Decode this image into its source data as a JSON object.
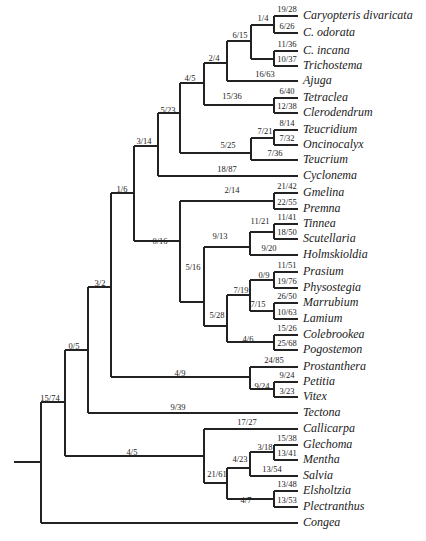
{
  "diagram": {
    "type": "phylogenetic-tree",
    "colors": {
      "line": "#222222",
      "text": "#1a1a1a",
      "background": "#ffffff"
    },
    "taxa": [
      {
        "name": "Caryopteris divaricata",
        "y": 16
      },
      {
        "name": "C. odorata",
        "y": 33
      },
      {
        "name": "C. incana",
        "y": 51
      },
      {
        "name": "Trichostema",
        "y": 66
      },
      {
        "name": "Ajuga",
        "y": 81
      },
      {
        "name": "Tetraclea",
        "y": 98
      },
      {
        "name": "Clerodendrum",
        "y": 113
      },
      {
        "name": "Teucridium",
        "y": 130
      },
      {
        "name": "Oncinocalyx",
        "y": 145
      },
      {
        "name": "Teucrium",
        "y": 160
      },
      {
        "name": "Cyclonema",
        "y": 176
      },
      {
        "name": "Gmelina",
        "y": 193
      },
      {
        "name": "Premna",
        "y": 209
      },
      {
        "name": "Tinnea",
        "y": 224
      },
      {
        "name": "Scutellaria",
        "y": 239
      },
      {
        "name": "Holmskioldia",
        "y": 255
      },
      {
        "name": "Prasium",
        "y": 272
      },
      {
        "name": "Physostegia",
        "y": 288
      },
      {
        "name": "Marrubium",
        "y": 303
      },
      {
        "name": "Lamium",
        "y": 319
      },
      {
        "name": "Colebrookea",
        "y": 335
      },
      {
        "name": "Pogostemon",
        "y": 350
      },
      {
        "name": "Prostanthera",
        "y": 367
      },
      {
        "name": "Petitia",
        "y": 382
      },
      {
        "name": "Vitex",
        "y": 397
      },
      {
        "name": "Tectona",
        "y": 413
      },
      {
        "name": "Callicarpa",
        "y": 429
      },
      {
        "name": "Glechoma",
        "y": 445
      },
      {
        "name": "Mentha",
        "y": 460
      },
      {
        "name": "Salvia",
        "y": 476
      },
      {
        "name": "Elsholtzia",
        "y": 491
      },
      {
        "name": "Plectranthus",
        "y": 507
      },
      {
        "name": "Congea",
        "y": 523
      }
    ],
    "branch_labels": [
      {
        "text": "19/28",
        "x": 287,
        "y": 5
      },
      {
        "text": "6/26",
        "x": 287,
        "y": 22
      },
      {
        "text": "1/4",
        "x": 263,
        "y": 14
      },
      {
        "text": "11/36",
        "x": 287,
        "y": 40
      },
      {
        "text": "10/37",
        "x": 287,
        "y": 55
      },
      {
        "text": "6/15",
        "x": 240,
        "y": 31
      },
      {
        "text": "16/63",
        "x": 265,
        "y": 70
      },
      {
        "text": "2/4",
        "x": 214,
        "y": 54
      },
      {
        "text": "6/40",
        "x": 287,
        "y": 87
      },
      {
        "text": "12/38",
        "x": 287,
        "y": 102
      },
      {
        "text": "15/36",
        "x": 232,
        "y": 92
      },
      {
        "text": "4/5",
        "x": 190,
        "y": 74
      },
      {
        "text": "8/14",
        "x": 287,
        "y": 119
      },
      {
        "text": "7/32",
        "x": 287,
        "y": 134
      },
      {
        "text": "7/21",
        "x": 265,
        "y": 127
      },
      {
        "text": "7/36",
        "x": 275,
        "y": 149
      },
      {
        "text": "5/25",
        "x": 228,
        "y": 141
      },
      {
        "text": "5/23",
        "x": 168,
        "y": 106
      },
      {
        "text": "18/87",
        "x": 227,
        "y": 165
      },
      {
        "text": "3/14",
        "x": 144,
        "y": 137
      },
      {
        "text": "21/42",
        "x": 287,
        "y": 182
      },
      {
        "text": "22/55",
        "x": 287,
        "y": 198
      },
      {
        "text": "2/14",
        "x": 232,
        "y": 186
      },
      {
        "text": "11/41",
        "x": 287,
        "y": 213
      },
      {
        "text": "18/50",
        "x": 287,
        "y": 228
      },
      {
        "text": "11/21",
        "x": 260,
        "y": 217
      },
      {
        "text": "9/20",
        "x": 269,
        "y": 244
      },
      {
        "text": "9/13",
        "x": 220,
        "y": 232
      },
      {
        "text": "11/51",
        "x": 287,
        "y": 261
      },
      {
        "text": "19/76",
        "x": 287,
        "y": 277
      },
      {
        "text": "0/9",
        "x": 264,
        "y": 271
      },
      {
        "text": "26/50",
        "x": 287,
        "y": 292
      },
      {
        "text": "10/63",
        "x": 287,
        "y": 308
      },
      {
        "text": "7/15",
        "x": 258,
        "y": 300
      },
      {
        "text": "7/19",
        "x": 241,
        "y": 286
      },
      {
        "text": "15/26",
        "x": 287,
        "y": 324
      },
      {
        "text": "25/68",
        "x": 287,
        "y": 339
      },
      {
        "text": "4/6",
        "x": 248,
        "y": 335
      },
      {
        "text": "5/28",
        "x": 217,
        "y": 311
      },
      {
        "text": "5/16",
        "x": 193,
        "y": 263
      },
      {
        "text": "0/16",
        "x": 160,
        "y": 237
      },
      {
        "text": "1/6",
        "x": 122,
        "y": 185
      },
      {
        "text": "24/85",
        "x": 274,
        "y": 356
      },
      {
        "text": "9/24",
        "x": 287,
        "y": 371
      },
      {
        "text": "3/23",
        "x": 287,
        "y": 387
      },
      {
        "text": "9/24",
        "x": 262,
        "y": 382
      },
      {
        "text": "4/9",
        "x": 180,
        "y": 369
      },
      {
        "text": "3/2",
        "x": 100,
        "y": 279
      },
      {
        "text": "9/39",
        "x": 178,
        "y": 403
      },
      {
        "text": "0/5",
        "x": 74,
        "y": 342
      },
      {
        "text": "17/27",
        "x": 247,
        "y": 418
      },
      {
        "text": "15/38",
        "x": 287,
        "y": 434
      },
      {
        "text": "13/41",
        "x": 287,
        "y": 449
      },
      {
        "text": "3/18",
        "x": 265,
        "y": 443
      },
      {
        "text": "13/54",
        "x": 272,
        "y": 465
      },
      {
        "text": "4/23",
        "x": 240,
        "y": 455
      },
      {
        "text": "13/48",
        "x": 287,
        "y": 480
      },
      {
        "text": "13/53",
        "x": 287,
        "y": 496
      },
      {
        "text": "4/7",
        "x": 246,
        "y": 496
      },
      {
        "text": "21/61",
        "x": 217,
        "y": 470
      },
      {
        "text": "4/5",
        "x": 132,
        "y": 448
      },
      {
        "text": "15/74",
        "x": 50,
        "y": 394
      }
    ]
  }
}
